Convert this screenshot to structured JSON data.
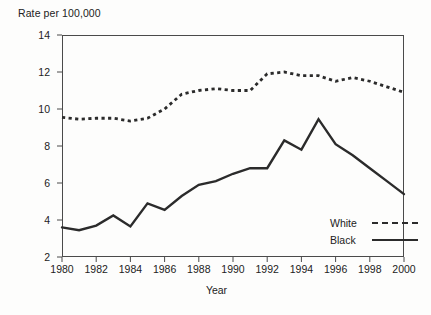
{
  "chart_data": {
    "type": "line",
    "title": "",
    "ylabel": "Rate per 100,000",
    "xlabel": "Year",
    "ylim": [
      2,
      14
    ],
    "xlim": [
      1980,
      2000
    ],
    "yticks": [
      2,
      4,
      6,
      8,
      10,
      12,
      14
    ],
    "xticks": [
      1980,
      1982,
      1984,
      1986,
      1988,
      1990,
      1992,
      1994,
      1996,
      1998,
      2000
    ],
    "grid": false,
    "legend_position": "bottom-right",
    "x": [
      1980,
      1981,
      1982,
      1983,
      1984,
      1985,
      1986,
      1987,
      1988,
      1989,
      1990,
      1991,
      1992,
      1993,
      1994,
      1995,
      1996,
      1997,
      1998,
      1999,
      2000
    ],
    "series": [
      {
        "name": "White",
        "style": "dashed",
        "color": "#2b2b2b",
        "values": [
          9.55,
          9.45,
          9.5,
          9.5,
          9.35,
          9.5,
          10.0,
          10.8,
          11.0,
          11.1,
          11.0,
          11.0,
          11.9,
          12.0,
          11.8,
          11.8,
          11.5,
          11.7,
          11.5,
          11.2,
          10.9
        ]
      },
      {
        "name": "Black",
        "style": "solid",
        "color": "#2b2b2b",
        "values": [
          3.6,
          3.45,
          3.7,
          4.25,
          3.65,
          4.9,
          4.55,
          5.3,
          5.9,
          6.1,
          6.5,
          6.8,
          6.8,
          8.3,
          7.8,
          9.45,
          8.1,
          7.5,
          6.8,
          6.1,
          5.4
        ]
      }
    ]
  },
  "axes": {
    "ylabel_text": "Rate per 100,000",
    "xlabel_text": "Year",
    "ytick_labels": [
      "14",
      "12",
      "10",
      "8",
      "6",
      "4",
      "2"
    ],
    "xtick_labels": [
      "1980",
      "1982",
      "1984",
      "1986",
      "1988",
      "1990",
      "1992",
      "1994",
      "1996",
      "1998",
      "2000"
    ]
  },
  "legend": {
    "entries": [
      {
        "label": "White",
        "style": "dashed"
      },
      {
        "label": "Black",
        "style": "solid"
      }
    ]
  }
}
